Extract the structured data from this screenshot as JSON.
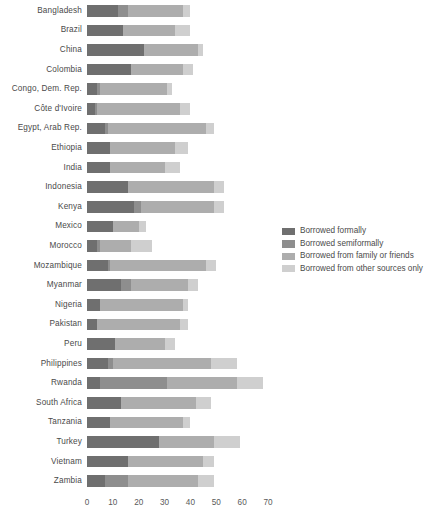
{
  "chart_data": {
    "type": "bar",
    "orientation": "horizontal",
    "stacked": true,
    "title": "",
    "subtitle": "",
    "xlabel": "",
    "ylabel": "",
    "xlim": [
      0,
      73
    ],
    "xticks": [
      0,
      10,
      20,
      30,
      40,
      50,
      60,
      70
    ],
    "grid": false,
    "legend_position": "right-middle",
    "colors": {
      "borrowed_formally": "#6f6f6f",
      "borrowed_semiformally": "#8e8e8e",
      "borrowed_family_friends": "#adadad",
      "borrowed_other_sources_only": "#cfcfcf",
      "text": "#4a4a4a",
      "background": "#ffffff"
    },
    "categories": [
      "Bangladesh",
      "Brazil",
      "China",
      "Colombia",
      "Congo, Dem. Rep.",
      "Côte d'Ivoire",
      "Egypt, Arab Rep.",
      "Ethiopia",
      "India",
      "Indonesia",
      "Kenya",
      "Mexico",
      "Morocco",
      "Mozambique",
      "Myanmar",
      "Nigeria",
      "Pakistan",
      "Peru",
      "Philippines",
      "Rwanda",
      "South Africa",
      "Tanzania",
      "Turkey",
      "Vietnam",
      "Zambia"
    ],
    "series": [
      {
        "name": "Borrowed formally",
        "key": "borrowed_formally",
        "color": "#6f6f6f",
        "values": [
          12,
          14,
          22,
          17,
          4,
          3,
          7,
          9,
          9,
          16,
          18,
          10,
          4,
          8,
          13,
          5,
          4,
          11,
          8,
          5,
          13,
          9,
          28,
          16,
          7
        ]
      },
      {
        "name": "Borrowed semiformally",
        "key": "borrowed_semiformally",
        "color": "#8e8e8e",
        "values": [
          4,
          0,
          0,
          0,
          1,
          1,
          1,
          0,
          0,
          0,
          3,
          0,
          1,
          1,
          4,
          0,
          0,
          0,
          2,
          26,
          0,
          0,
          0,
          0,
          9
        ]
      },
      {
        "name": "Borrowed from family or friends",
        "key": "borrowed_family_friends",
        "color": "#adadad",
        "values": [
          21,
          20,
          21,
          20,
          26,
          32,
          38,
          25,
          21,
          33,
          28,
          10,
          12,
          37,
          22,
          32,
          32,
          19,
          38,
          27,
          29,
          28,
          21,
          29,
          27
        ]
      },
      {
        "name": "Borrowed from other sources only",
        "key": "borrowed_other_sources_only",
        "color": "#cfcfcf",
        "values": [
          3,
          6,
          2,
          4,
          2,
          4,
          3,
          5,
          6,
          4,
          4,
          3,
          8,
          4,
          4,
          2,
          3,
          4,
          10,
          10,
          6,
          3,
          10,
          4,
          6
        ]
      }
    ],
    "totals": [
      40,
      40,
      45,
      41,
      33,
      40,
      49,
      39,
      36,
      53,
      53,
      23,
      25,
      50,
      43,
      39,
      39,
      34,
      58,
      68,
      48,
      40,
      59,
      49,
      49
    ]
  },
  "legend": {
    "items": [
      {
        "label": "Borrowed formally",
        "color": "#6f6f6f"
      },
      {
        "label": "Borrowed semiformally",
        "color": "#8e8e8e"
      },
      {
        "label": "Borrowed from family or friends",
        "color": "#adadad"
      },
      {
        "label": "Borrowed from other sources only",
        "color": "#cfcfcf"
      }
    ]
  }
}
